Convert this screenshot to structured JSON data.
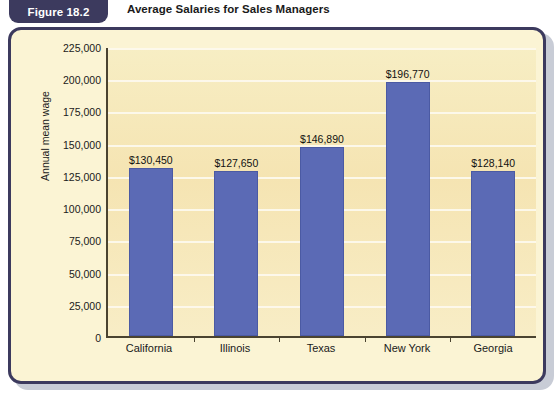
{
  "figure": {
    "tab_label": "Figure 18.2",
    "title": "Average Salaries for Sales Managers"
  },
  "colors": {
    "bar": "#5b6ab5",
    "tab_background": "#3c3a5e",
    "card_border": "#3c3a5e",
    "plot_background": "#f5e4b2",
    "gridline": "#fdfaf0"
  },
  "chart_data": {
    "type": "bar",
    "title": "Average Salaries for Sales Managers",
    "xlabel": "",
    "ylabel": "Annual mean wage",
    "categories": [
      "California",
      "Illinois",
      "Texas",
      "New York",
      "Georgia"
    ],
    "values": [
      130450,
      127650,
      146890,
      196770,
      128140
    ],
    "data_labels": [
      "$130,450",
      "$127,650",
      "$146,890",
      "$196,770",
      "$128,140"
    ],
    "ylim": [
      0,
      225000
    ],
    "ytick_step": 25000,
    "ytick_labels": [
      "225,000",
      "200,000",
      "175,000",
      "150,000",
      "125,000",
      "100,000",
      "75,000",
      "50,000",
      "25,000",
      "0"
    ],
    "ytick_values": [
      225000,
      200000,
      175000,
      150000,
      125000,
      100000,
      75000,
      50000,
      25000,
      0
    ],
    "grid": true,
    "legend": false
  }
}
